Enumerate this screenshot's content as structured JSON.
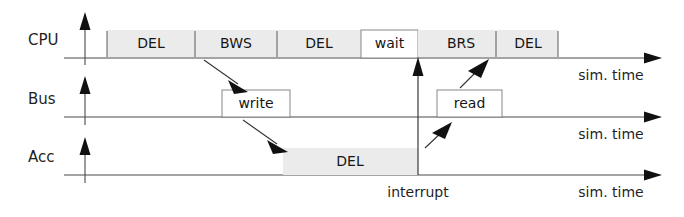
{
  "diagram": {
    "kind": "timing-diagram",
    "background_color": "#ffffff",
    "block_fill_color": "#ebebeb",
    "line_color": "#3a3a3a",
    "lanes": [
      {
        "id": "cpu",
        "name": "CPU",
        "axis_label": "sim. time",
        "blocks": [
          {
            "label": "DEL",
            "x": 107,
            "width": 88,
            "style": "shaded"
          },
          {
            "label": "BWS",
            "x": 195,
            "width": 82,
            "style": "shaded"
          },
          {
            "label": "DEL",
            "x": 277,
            "width": 84,
            "style": "shaded"
          },
          {
            "label": "wait",
            "x": 361,
            "width": 57,
            "style": "outline"
          },
          {
            "label": "BRS",
            "x": 418,
            "width": 78,
            "style": "shaded"
          },
          {
            "label": "DEL",
            "x": 496,
            "width": 62,
            "style": "shaded"
          }
        ]
      },
      {
        "id": "bus",
        "name": "Bus",
        "axis_label": "sim. time",
        "blocks": [
          {
            "label": "write",
            "x": 222,
            "width": 68,
            "style": "outline"
          },
          {
            "label": "read",
            "x": 437,
            "width": 65,
            "style": "outline"
          }
        ]
      },
      {
        "id": "acc",
        "name": "Acc",
        "axis_label": "sim. time",
        "blocks": [
          {
            "label": "DEL",
            "x": 283,
            "width": 135,
            "style": "shaded"
          }
        ]
      }
    ],
    "annotations": [
      {
        "id": "interrupt",
        "label": "interrupt",
        "x": 418,
        "y": 193
      }
    ],
    "connectors": [
      {
        "id": "cpu-bws-to-bus-write",
        "from": "CPU/BWS",
        "to": "Bus/write"
      },
      {
        "id": "bus-write-to-acc-del",
        "from": "Bus/write",
        "to": "Acc/DEL"
      },
      {
        "id": "acc-interrupt-to-bus-read",
        "from": "interrupt",
        "to": "Bus/read"
      },
      {
        "id": "bus-read-to-cpu-brs",
        "from": "Bus/read",
        "to": "CPU/BRS"
      },
      {
        "id": "interrupt-riser",
        "from": "interrupt",
        "to": "CPU/wait-end"
      }
    ]
  }
}
